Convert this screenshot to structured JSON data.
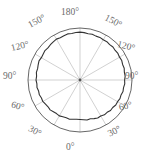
{
  "chart_data": {
    "type": "line",
    "plot_style": "polar",
    "title": "",
    "xlabel": "",
    "ylabel": "",
    "grid": true,
    "legend": null,
    "angle_unit": "degrees",
    "theta_zero_location": "S",
    "theta_direction": "mirrored",
    "rlim": [
      0,
      1
    ],
    "r_ticks_shown": false,
    "outer_circle_radius": 1.0,
    "tick_labels": {
      "top": "180°",
      "bottom": "0°",
      "left": [
        "150°",
        "120°",
        "90°",
        "60°",
        "30°"
      ],
      "right": [
        "150°",
        "120°",
        "90°",
        "60°",
        "30°"
      ]
    },
    "labels": {
      "l180": "180°",
      "l150_left": "150°",
      "l120_left": "120°",
      "l90_left": "90°",
      "l60_left": "60°",
      "l30_left": "30°",
      "l0": "0°",
      "l30_right": "30°",
      "l60_right": "60°",
      "l90_right": "90°",
      "l120_right": "120°",
      "l150_right": "150°"
    },
    "gridline_angles_deg": [
      0,
      30,
      60,
      90,
      120,
      150,
      180,
      210,
      240,
      270,
      300,
      330
    ],
    "series": [
      {
        "name": "radial-profile",
        "color": "#333333",
        "closed": true,
        "theta_deg": [
          0,
          5,
          10,
          15,
          20,
          25,
          30,
          35,
          40,
          45,
          50,
          55,
          60,
          65,
          70,
          75,
          80,
          85,
          90,
          95,
          100,
          105,
          110,
          115,
          120,
          125,
          130,
          135,
          140,
          145,
          150,
          155,
          160,
          165,
          170,
          175,
          180,
          185,
          190,
          195,
          200,
          205,
          210,
          215,
          220,
          225,
          230,
          235,
          240,
          245,
          250,
          255,
          260,
          265,
          270,
          275,
          280,
          285,
          290,
          295,
          300,
          305,
          310,
          315,
          320,
          325,
          330,
          335,
          340,
          345,
          350,
          355
        ],
        "r": [
          0.76,
          0.768,
          0.782,
          0.772,
          0.79,
          0.806,
          0.798,
          0.818,
          0.812,
          0.83,
          0.822,
          0.84,
          0.834,
          0.848,
          0.84,
          0.856,
          0.85,
          0.864,
          0.858,
          0.872,
          0.866,
          0.88,
          0.872,
          0.886,
          0.878,
          0.89,
          0.884,
          0.896,
          0.888,
          0.9,
          0.894,
          0.904,
          0.898,
          0.91,
          0.904,
          0.914,
          0.92,
          0.916,
          0.908,
          0.918,
          0.906,
          0.898,
          0.908,
          0.896,
          0.886,
          0.872,
          0.88,
          0.866,
          0.858,
          0.87,
          0.856,
          0.844,
          0.852,
          0.838,
          0.846,
          0.832,
          0.84,
          0.824,
          0.832,
          0.818,
          0.826,
          0.81,
          0.802,
          0.812,
          0.796,
          0.788,
          0.796,
          0.78,
          0.772,
          0.78,
          0.766,
          0.758
        ]
      }
    ]
  },
  "style": {
    "outer_circle_color": "#555555",
    "gridline_color": "#bdbdbd",
    "data_color": "#333333",
    "center_dot_color": "#555555",
    "label_color": "#6a6a6a",
    "background": "#ffffff"
  }
}
